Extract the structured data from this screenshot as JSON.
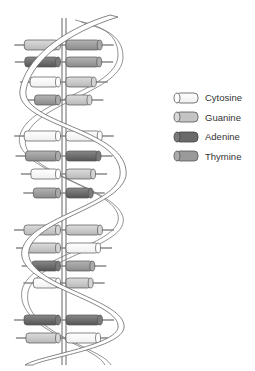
{
  "diagram": {
    "legend": {
      "items": [
        {
          "key": "cytosine",
          "label": "Cytosine",
          "color": "#ffffff"
        },
        {
          "key": "guanine",
          "label": "Guanine",
          "color": "#c4c4c4"
        },
        {
          "key": "adenine",
          "label": "Adenine",
          "color": "#6a6a6a"
        },
        {
          "key": "thymine",
          "label": "Thymine",
          "color": "#9a9a9a"
        }
      ]
    },
    "base_pairs": [
      {
        "y": 45,
        "left": "guanine",
        "right": "thymine"
      },
      {
        "y": 62,
        "left": "adenine",
        "right": "thymine"
      },
      {
        "y": 82,
        "left": "cytosine",
        "right": "guanine"
      },
      {
        "y": 100,
        "left": "thymine",
        "right": "guanine"
      },
      {
        "y": 136,
        "left": "cytosine",
        "right": "cytosine"
      },
      {
        "y": 156,
        "left": "thymine",
        "right": "adenine"
      },
      {
        "y": 174,
        "left": "cytosine",
        "right": "guanine"
      },
      {
        "y": 193,
        "left": "thymine",
        "right": "adenine"
      },
      {
        "y": 230,
        "left": "guanine",
        "right": "guanine"
      },
      {
        "y": 248,
        "left": "guanine",
        "right": "cytosine"
      },
      {
        "y": 266,
        "left": "adenine",
        "right": "thymine"
      },
      {
        "y": 283,
        "left": "cytosine",
        "right": "guanine"
      },
      {
        "y": 320,
        "left": "adenine",
        "right": "adenine"
      },
      {
        "y": 338,
        "left": "guanine",
        "right": "cytosine"
      }
    ]
  }
}
